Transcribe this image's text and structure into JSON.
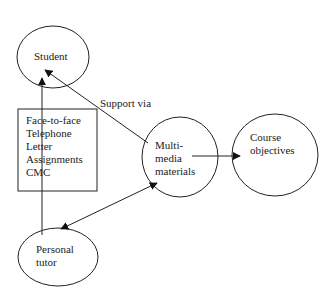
{
  "diagram": {
    "nodes": {
      "student": {
        "label": "Student"
      },
      "multimedia": {
        "label_lines": [
          "Multi-",
          "media",
          "materials"
        ]
      },
      "course": {
        "label_lines": [
          "Course",
          "objectives"
        ]
      },
      "tutor": {
        "label_lines": [
          "Personal",
          "tutor"
        ]
      }
    },
    "support_box": {
      "items": [
        "Face-to-face",
        "Telephone",
        "Letter",
        "Assignments",
        "CMC"
      ]
    },
    "edge_labels": {
      "support_via": "Support via"
    },
    "edges": [
      {
        "from": "multimedia",
        "to": "student",
        "type": "arrow"
      },
      {
        "from": "tutor",
        "to": "student",
        "type": "arrow"
      },
      {
        "from": "multimedia",
        "to": "tutor",
        "type": "double-arrow"
      },
      {
        "from": "multimedia",
        "to": "course",
        "type": "arrow"
      }
    ],
    "colors": {
      "stroke": "#222222",
      "background": "#ffffff"
    }
  }
}
